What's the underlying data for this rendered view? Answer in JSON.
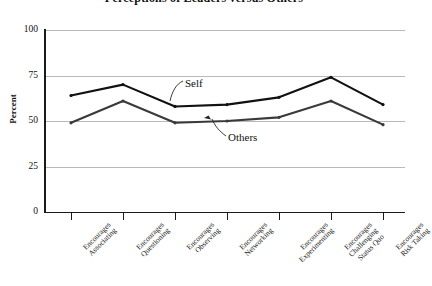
{
  "chart_data": {
    "type": "line",
    "title": "Perceptions of Leaders versus Others",
    "xlabel": "",
    "ylabel": "Percent",
    "ylim": [
      0,
      100
    ],
    "yticks": [
      "0",
      "25",
      "50",
      "75",
      "100"
    ],
    "grid": true,
    "legend_position": "inline-annotations",
    "categories": [
      "Encourages Associating",
      "Encourages Questioning",
      "Encourages Observing",
      "Encourages Networking",
      "Encourages Experimenting",
      "Encourages Challenging Status Quo",
      "Encourages Risk Taking"
    ],
    "category_lines": [
      [
        "Encourages",
        "Associating"
      ],
      [
        "Encourages",
        "Questioning"
      ],
      [
        "Encourages",
        "Observing"
      ],
      [
        "Encourages",
        "Networking"
      ],
      [
        "Encourages",
        "Experimenting"
      ],
      [
        "Encourages",
        "Challenging",
        "Status Quo"
      ],
      [
        "Encourages",
        "Risk Taking"
      ]
    ],
    "series": [
      {
        "name": "Self",
        "color": "#111111",
        "values": [
          64,
          70,
          58,
          59,
          63,
          74,
          59
        ]
      },
      {
        "name": "Others",
        "color": "#3a3a3a",
        "values": [
          49,
          61,
          49,
          50,
          52,
          61,
          48
        ]
      }
    ],
    "annotations": [
      {
        "name": "Self",
        "text": "Self"
      },
      {
        "name": "Others",
        "text": "Others"
      }
    ]
  },
  "yticks": {
    "t0": "0",
    "t1": "25",
    "t2": "50",
    "t3": "75",
    "t4": "100"
  },
  "cats": {
    "c0l0": "Encourages",
    "c0l1": "Associating",
    "c1l0": "Encourages",
    "c1l1": "Questioning",
    "c2l0": "Encourages",
    "c2l1": "Observing",
    "c3l0": "Encourages",
    "c3l1": "Networking",
    "c4l0": "Encourages",
    "c4l1": "Experimenting",
    "c5l0": "Encourages",
    "c5l1": "Challenging",
    "c5l2": "Status Quo",
    "c6l0": "Encourages",
    "c6l1": "Risk Taking"
  },
  "annot": {
    "self": "Self",
    "others": "Others"
  },
  "axis": {
    "ylabel": "Percent"
  },
  "title": "Perceptions of Leaders versus Others"
}
